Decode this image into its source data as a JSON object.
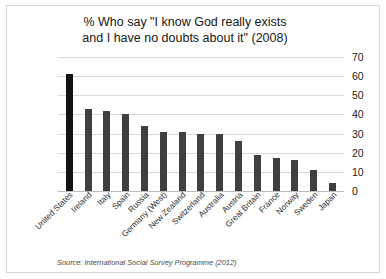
{
  "chart_data": {
    "type": "bar",
    "title": "% Who say \"I know God really exists and I have no doubts about it\" (2008)",
    "title_lines": [
      "% Who say \"I know God really exists",
      "and I have no doubts about it\" (2008)"
    ],
    "xlabel": "",
    "ylabel": "",
    "ylim": [
      0,
      70
    ],
    "y_ticks": [
      0,
      10,
      20,
      30,
      40,
      50,
      60,
      70
    ],
    "y_axis_position": "right",
    "grid": true,
    "legend": "none",
    "categories": [
      "United States",
      "Ireland",
      "Italy",
      "Spain",
      "Russia",
      "Germany (West)",
      "New Zealand",
      "Switzerland",
      "Australia",
      "Austria",
      "Great Britain",
      "France",
      "Norway",
      "Sweden",
      "Japan"
    ],
    "values": [
      61,
      43,
      42,
      40,
      34,
      31,
      31,
      30,
      30,
      26,
      19,
      17,
      16,
      11,
      4
    ],
    "highlight_index": 0,
    "colors": {
      "bar": "#3f3f3f",
      "bar_highlight": "#121212",
      "gridline": "#d9d9d9",
      "text": "#222222",
      "background": "#ffffff",
      "border": "#d6d6d6"
    },
    "source": "Source: International Social Survey Programme (2012)"
  }
}
